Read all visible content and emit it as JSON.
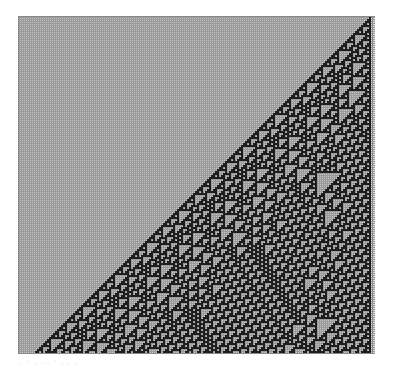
{
  "figure": {
    "type": "cellular-automaton",
    "rule": 110,
    "cell_size_px": 2,
    "columns": 176,
    "rows": 168,
    "initial_condition": "single black cell at right edge",
    "colors": {
      "on": "#1e1e1e",
      "off": "#c4c4c4",
      "grid_line": "#9a9a9a",
      "border": "#8a8a8a",
      "boundary_strip": "#d8d8d8"
    }
  },
  "caption": "· ˙ · ·  · ˙ ·  · ·"
}
